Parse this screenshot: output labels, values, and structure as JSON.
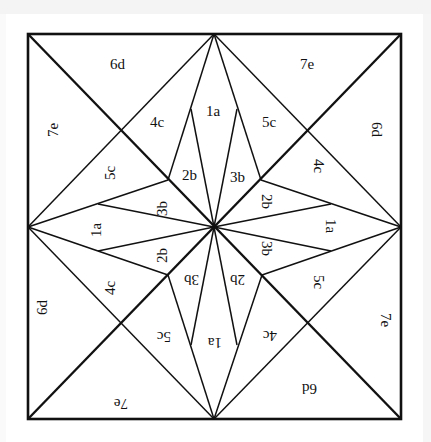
{
  "diagram": {
    "type": "quilt-block-pattern",
    "labels": {
      "top_left_6d": "6d",
      "top_right_7e": "7e",
      "left_top_7e": "7e",
      "right_top_6d": "6d",
      "left_bottom_6d": "6d",
      "right_bottom_7e": "7e",
      "bottom_left_7e": "7e",
      "bottom_right_6d": "6d",
      "n_4c": "4c",
      "n_1a": "1a",
      "n_5c": "5c",
      "n_2b": "2b",
      "n_3b": "3b",
      "w_5c": "5c",
      "w_3b": "3b",
      "w_1a": "1a",
      "w_2b": "2b",
      "w_4c": "4c",
      "e_4c": "4c",
      "e_2b": "2b",
      "e_1a": "1a",
      "e_3b": "3b",
      "e_5c": "5c",
      "s_5c": "5c",
      "s_3b": "3b",
      "s_2b": "2b",
      "s_1a": "1a",
      "s_4c": "4c"
    },
    "colors": {
      "line": "#111111",
      "background": "#ffffff"
    }
  }
}
